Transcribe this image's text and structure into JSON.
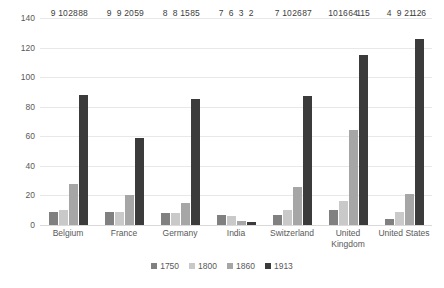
{
  "chart_data": {
    "type": "bar",
    "title": "",
    "xlabel": "",
    "ylabel": "UK 1900 = 100",
    "ylim": [
      0,
      140
    ],
    "ytick_step": 20,
    "yticks": [
      0,
      20,
      40,
      60,
      80,
      100,
      120,
      140
    ],
    "grid": true,
    "legend_position": "bottom",
    "categories": [
      "Belgium",
      "France",
      "Germany",
      "India",
      "Switzerland",
      "United Kingdom",
      "United States"
    ],
    "series": [
      {
        "name": "1750",
        "color": "#808080",
        "values": [
          9,
          9,
          8,
          7,
          7,
          10,
          4
        ]
      },
      {
        "name": "1800",
        "color": "#c9c9c9",
        "values": [
          10,
          9,
          8,
          6,
          10,
          16,
          9
        ]
      },
      {
        "name": "1860",
        "color": "#a6a6a6",
        "values": [
          28,
          20,
          15,
          3,
          26,
          64,
          21
        ]
      },
      {
        "name": "1913",
        "color": "#3b3b3b",
        "values": [
          88,
          59,
          85,
          2,
          87,
          115,
          126
        ]
      }
    ]
  }
}
